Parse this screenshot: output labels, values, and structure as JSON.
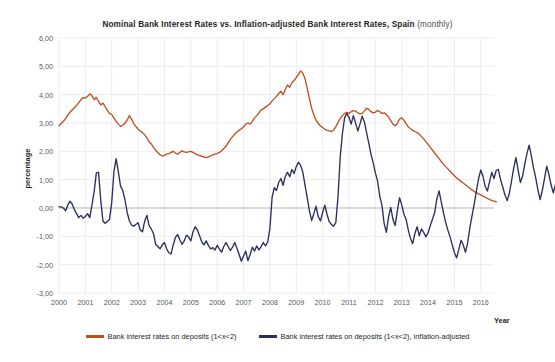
{
  "chart_data": {
    "type": "line",
    "title_bold": "Nominal Bank Interest Rates vs. Inflation-adjusted  Bank Interest Rates, Spain",
    "title_regular": "(monthly)",
    "xlabel": "Year",
    "ylabel": "percentage",
    "ylim": [
      -3.0,
      6.0
    ],
    "ytick_labels": [
      "6,00",
      "5,00",
      "4,00",
      "3,00",
      "2,00",
      "1,00",
      "0,00",
      "-1,00",
      "-2,00",
      "-3,00"
    ],
    "ytick_values": [
      6,
      5,
      4,
      3,
      2,
      1,
      0,
      -1,
      -2,
      -3
    ],
    "xtick_labels": [
      "2000",
      "2001",
      "2002",
      "2003",
      "2004",
      "2005",
      "2006",
      "2007",
      "2008",
      "2009",
      "2010",
      "2011",
      "2012",
      "2013",
      "2014",
      "2015",
      "2016"
    ],
    "xlim": [
      2000.0,
      2016.5
    ],
    "grid": true,
    "zero_line": true,
    "legend_position": "bottom",
    "colors": {
      "nominal": "#c0501e",
      "real": "#2b2f5e",
      "grid": "#e9e6ef",
      "zero": "#b8b8b8"
    },
    "series": [
      {
        "name": "Bank interest rates on deposits (1<x<2)",
        "color": "#c0501e",
        "x_start": 2000.0,
        "x_step": 0.08333,
        "values": [
          2.9,
          2.98,
          3.06,
          3.16,
          3.28,
          3.38,
          3.46,
          3.54,
          3.62,
          3.72,
          3.82,
          3.9,
          3.88,
          3.94,
          4.03,
          3.96,
          3.82,
          3.9,
          3.76,
          3.64,
          3.7,
          3.58,
          3.44,
          3.34,
          3.3,
          3.18,
          3.06,
          2.96,
          2.88,
          2.92,
          3.0,
          3.1,
          3.26,
          3.14,
          2.98,
          2.88,
          2.78,
          2.72,
          2.66,
          2.58,
          2.48,
          2.34,
          2.26,
          2.14,
          2.04,
          1.96,
          1.88,
          1.84,
          1.86,
          1.9,
          1.92,
          1.96,
          2.0,
          1.94,
          1.9,
          1.96,
          2.02,
          1.98,
          1.96,
          1.98,
          2.0,
          1.96,
          1.92,
          1.88,
          1.86,
          1.82,
          1.8,
          1.78,
          1.8,
          1.84,
          1.88,
          1.9,
          1.92,
          1.96,
          2.02,
          2.1,
          2.18,
          2.3,
          2.42,
          2.52,
          2.6,
          2.68,
          2.74,
          2.8,
          2.86,
          2.96,
          3.0,
          2.96,
          3.06,
          3.18,
          3.26,
          3.36,
          3.46,
          3.5,
          3.56,
          3.62,
          3.68,
          3.78,
          3.86,
          3.94,
          4.04,
          4.12,
          4.0,
          4.18,
          4.34,
          4.26,
          4.42,
          4.5,
          4.6,
          4.72,
          4.84,
          4.76,
          4.56,
          4.22,
          3.86,
          3.52,
          3.28,
          3.1,
          2.98,
          2.9,
          2.84,
          2.78,
          2.74,
          2.72,
          2.7,
          2.74,
          2.86,
          3.02,
          3.16,
          3.26,
          3.34,
          3.38,
          3.34,
          3.4,
          3.44,
          3.42,
          3.36,
          3.32,
          3.34,
          3.42,
          3.52,
          3.48,
          3.4,
          3.36,
          3.38,
          3.44,
          3.4,
          3.34,
          3.36,
          3.3,
          3.22,
          3.08,
          2.96,
          2.9,
          2.98,
          3.14,
          3.18,
          3.1,
          2.98,
          2.86,
          2.8,
          2.74,
          2.7,
          2.66,
          2.6,
          2.52,
          2.44,
          2.34,
          2.24,
          2.14,
          2.04,
          1.94,
          1.84,
          1.74,
          1.64,
          1.54,
          1.46,
          1.38,
          1.3,
          1.22,
          1.14,
          1.06,
          1.0,
          0.94,
          0.88,
          0.82,
          0.76,
          0.7,
          0.64,
          0.58,
          0.54,
          0.5,
          0.46,
          0.42,
          0.38,
          0.34,
          0.3,
          0.26,
          0.24,
          0.22
        ]
      },
      {
        "name": "Bank interest rates on deposits (1<x<2), inflation-adjusted",
        "color": "#2b2f5e",
        "x_start": 2000.0,
        "x_step": 0.08333,
        "values": [
          0.05,
          0.04,
          0.0,
          -0.1,
          0.1,
          0.24,
          0.14,
          -0.06,
          -0.2,
          -0.34,
          -0.26,
          -0.36,
          -0.3,
          -0.2,
          -0.34,
          0.1,
          0.58,
          1.24,
          1.26,
          0.28,
          -0.46,
          -0.54,
          -0.48,
          -0.4,
          0.2,
          1.28,
          1.74,
          1.28,
          0.78,
          0.62,
          0.3,
          -0.14,
          -0.44,
          -0.6,
          -0.64,
          -0.58,
          -0.52,
          -0.78,
          -0.84,
          -0.46,
          -0.26,
          -0.62,
          -0.74,
          -0.9,
          -1.28,
          -1.36,
          -1.44,
          -1.3,
          -1.22,
          -1.44,
          -1.58,
          -1.62,
          -1.3,
          -1.04,
          -0.94,
          -1.12,
          -1.28,
          -1.16,
          -0.96,
          -1.02,
          -1.16,
          -0.84,
          -0.66,
          -0.78,
          -0.98,
          -1.2,
          -1.3,
          -1.16,
          -1.32,
          -1.44,
          -1.4,
          -1.48,
          -1.32,
          -1.44,
          -1.56,
          -1.36,
          -1.22,
          -1.36,
          -1.5,
          -1.38,
          -1.22,
          -1.42,
          -1.64,
          -1.88,
          -1.7,
          -1.52,
          -1.86,
          -1.64,
          -1.38,
          -1.52,
          -1.34,
          -1.48,
          -1.36,
          -1.22,
          -1.34,
          -1.2,
          -0.72,
          0.38,
          0.72,
          0.62,
          0.9,
          1.04,
          0.8,
          1.12,
          1.26,
          1.1,
          1.36,
          1.22,
          1.46,
          1.62,
          1.5,
          1.26,
          0.8,
          0.36,
          -0.1,
          -0.44,
          -0.2,
          0.06,
          -0.3,
          -0.46,
          -0.16,
          0.1,
          -0.22,
          -0.48,
          -0.58,
          -0.64,
          -0.52,
          0.4,
          1.8,
          2.62,
          3.18,
          3.34,
          3.2,
          2.96,
          3.26,
          3.0,
          2.72,
          2.96,
          3.24,
          3.04,
          2.66,
          2.3,
          1.9,
          1.6,
          1.24,
          0.96,
          0.42,
          0.1,
          -0.54,
          -0.86,
          -0.32,
          0.02,
          -0.4,
          -0.62,
          -0.1,
          0.36,
          0.12,
          -0.22,
          -0.4,
          -0.78,
          -1.08,
          -1.26,
          -0.9,
          -0.66,
          -0.98,
          -0.74,
          -0.86,
          -1.02,
          -0.88,
          -0.62,
          -0.4,
          -0.16,
          0.32,
          0.6,
          0.22,
          -0.16,
          -0.5,
          -0.78,
          -1.02,
          -1.3,
          -1.58,
          -1.76,
          -1.46,
          -1.14,
          -1.3,
          -1.56,
          -1.24,
          -0.7,
          -0.28,
          0.14,
          0.6,
          1.04,
          1.34,
          1.12,
          0.76,
          0.6,
          0.94,
          1.26,
          1.04,
          1.32,
          1.36,
          1.0,
          0.74,
          0.46,
          0.26,
          0.52,
          0.96,
          1.42,
          1.78,
          1.34,
          0.9,
          1.12,
          1.54,
          1.92,
          2.22,
          1.84,
          1.42,
          1.06,
          0.64,
          0.3,
          0.62,
          1.04,
          1.48,
          1.18,
          0.82,
          0.54,
          0.82,
          1.26,
          1.56,
          1.3,
          0.98,
          1.34,
          1.52,
          1.46
        ]
      }
    ]
  }
}
